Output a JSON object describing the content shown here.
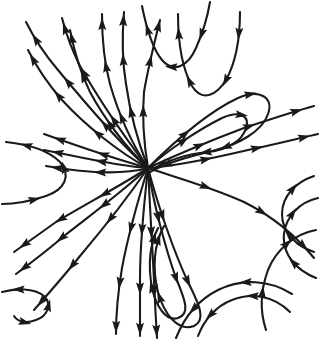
{
  "figure": {
    "kind": "phase-portrait",
    "title": "",
    "caption": "",
    "background_color": "#ffffff",
    "stroke_color": "#1a1a1a",
    "stroke_width": 2.1,
    "width": 319,
    "height": 340,
    "has_border": false,
    "has_axes": false,
    "has_labels": false,
    "has_gridlines": false
  },
  "chart_data": {
    "type": "line",
    "title": "",
    "xlabel": "",
    "ylabel": "",
    "xlim": [
      0,
      319
    ],
    "ylim": [
      0,
      340
    ],
    "grid": false,
    "legend": "none",
    "critical_points": [
      {
        "name": "degenerate-node",
        "x": 148,
        "y": 168,
        "classification": "improper/degenerate node (saddle-node)"
      }
    ],
    "separatrix_directions_deg": [
      205,
      25,
      95,
      275
    ],
    "streamline_count": 28,
    "arrow_count": 92,
    "streamlines": [
      {
        "id": "s01",
        "d": "M 148 168 C 120 144 86 104 58 70 C 46 56 34 38 26 22",
        "arrows": [
          0.3,
          0.6,
          0.88
        ],
        "dir": "forward"
      },
      {
        "id": "s02",
        "d": "M 148 168 C 124 136 98 98 80 66 C 72 50 66 34 62 18",
        "arrows": [
          0.32,
          0.64,
          0.92
        ],
        "dir": "forward"
      },
      {
        "id": "s03",
        "d": "M 148 168 C 118 152 84 124 62 100 C 48 84 36 66 28 50",
        "arrows": [
          0.34,
          0.66,
          0.92
        ],
        "dir": "forward"
      },
      {
        "id": "s04",
        "d": "M 148 168 C 126 148 104 118 90 92 C 80 72 74 50 70 30",
        "arrows": [
          0.34,
          0.68,
          0.93
        ],
        "dir": "forward"
      },
      {
        "id": "s05",
        "d": "M 148 168 C 132 144 118 112 110 84 C 104 62 102 38 102 14",
        "arrows": [
          0.33,
          0.66,
          0.92
        ],
        "dir": "forward"
      },
      {
        "id": "s06",
        "d": "M 148 168 C 138 142 130 112 126 84 C 122 60 122 36 124 12",
        "arrows": [
          0.35,
          0.68,
          0.93
        ],
        "dir": "forward"
      },
      {
        "id": "s07",
        "d": "M 148 168 C 144 144 142 116 144 92 C 148 68 154 44 160 20",
        "arrows": [
          0.36,
          0.7,
          0.94
        ],
        "dir": "forward"
      },
      {
        "id": "s08",
        "d": "M 148 168 C 112 158 72 144 44 134",
        "arrows": [
          0.4,
          0.82
        ],
        "dir": "forward"
      },
      {
        "id": "s09",
        "d": "M 148 168 C 116 166 76 156 44 150",
        "arrows": [
          0.42,
          0.84
        ],
        "dir": "forward"
      },
      {
        "id": "s10",
        "d": "M 148 168 C 118 176 80 172 46 166",
        "arrows": [
          0.44,
          0.86
        ],
        "dir": "forward"
      },
      {
        "id": "s11",
        "d": "M 148 168 C 120 186 86 204 56 222 C 42 232 28 242 14 252",
        "arrows": [
          0.3,
          0.62,
          0.9
        ],
        "dir": "forward"
      },
      {
        "id": "s12",
        "d": "M 148 168 C 122 192 92 214 64 236 C 48 250 32 262 16 274",
        "arrows": [
          0.32,
          0.64,
          0.92
        ],
        "dir": "forward"
      },
      {
        "id": "s13",
        "d": "M 148 168 C 126 200 102 230 80 256 C 64 276 48 294 34 310",
        "arrows": [
          0.33,
          0.66,
          0.92
        ],
        "dir": "forward"
      },
      {
        "id": "s14",
        "d": "M 148 168 C 138 200 128 236 122 268 C 118 292 116 314 116 334",
        "arrows": [
          0.35,
          0.68,
          0.94
        ],
        "dir": "forward"
      },
      {
        "id": "s15",
        "d": "M 148 168 C 144 204 140 244 140 278 C 140 302 140 320 140 336",
        "arrows": [
          0.35,
          0.7,
          0.94
        ],
        "dir": "forward"
      },
      {
        "id": "s16",
        "d": "M 148 168 C 150 206 152 246 154 280 C 155 304 156 322 157 338",
        "arrows": [
          0.36,
          0.7,
          0.94
        ],
        "dir": "forward"
      },
      {
        "id": "s17",
        "d": "M 148 168 C 154 206 166 250 176 278 C 186 302 190 314 178 318 C 166 322 156 306 152 288 C 148 266 150 244 158 228",
        "arrows": [
          0.18,
          0.42,
          0.76,
          0.95
        ],
        "dir": "forward"
      },
      {
        "id": "s18",
        "d": "M 148 168 C 158 206 174 252 188 282 C 200 306 206 320 194 326 C 178 332 164 314 158 292 C 152 268 154 244 164 226",
        "arrows": [
          0.16,
          0.4,
          0.74,
          0.94
        ],
        "dir": "forward"
      },
      {
        "id": "s19",
        "d": "M 148 168 C 168 150 198 130 222 118 C 240 110 250 116 246 128 C 242 142 226 150 208 152 C 188 154 168 160 152 170",
        "arrows": [
          0.18,
          0.46,
          0.74,
          0.94
        ],
        "dir": "forward"
      },
      {
        "id": "s20",
        "d": "M 148 168 C 172 144 208 112 238 98 C 260 88 274 98 268 114 C 262 132 238 144 216 150 C 192 156 168 162 150 172",
        "arrows": [
          0.16,
          0.42,
          0.72,
          0.93
        ],
        "dir": "forward"
      },
      {
        "id": "s21",
        "d": "M 148 168 C 174 156 212 140 244 128 C 268 120 292 112 314 106",
        "arrows": [
          0.3,
          0.6,
          0.88
        ],
        "dir": "forward"
      },
      {
        "id": "s22",
        "d": "M 148 168 C 176 166 214 158 248 150 C 276 144 300 138 318 134",
        "arrows": [
          0.32,
          0.62,
          0.9
        ],
        "dir": "forward"
      },
      {
        "id": "s23",
        "d": "M 148 168 C 178 178 214 188 244 202 C 272 216 296 236 314 258",
        "arrows": [
          0.3,
          0.62,
          0.9
        ],
        "dir": "forward"
      },
      {
        "id": "s24",
        "d": "M 178 14 C 178 40 182 68 192 86 C 202 102 216 96 226 80 C 236 62 240 36 240 12",
        "arrows": [
          0.12,
          0.38,
          0.64,
          0.9
        ],
        "dir": "reverse"
      },
      {
        "id": "s25",
        "d": "M 142 6 C 146 26 152 48 162 60 C 174 74 188 66 196 48 C 204 30 208 14 210 2",
        "arrows": [
          0.18,
          0.48,
          0.8
        ],
        "dir": "reverse"
      },
      {
        "id": "s26",
        "d": "M 6 142 C 26 144 48 150 60 162 C 72 176 64 190 46 196 C 28 202 12 204 2 204",
        "arrows": [
          0.16,
          0.46,
          0.8
        ],
        "dir": "reverse"
      },
      {
        "id": "s27",
        "d": "M 2 292 C 16 288 34 288 44 296 C 52 304 48 316 36 320 C 26 324 18 322 14 316",
        "arrows": [
          0.2,
          0.58,
          0.9
        ],
        "dir": "reverse"
      },
      {
        "id": "s28",
        "d": "M 314 176 C 296 182 282 196 282 214 C 282 232 296 246 314 252",
        "arrows": [
          0.26,
          0.74
        ],
        "dir": "reverse"
      },
      {
        "id": "s29",
        "d": "M 318 198 C 300 202 286 216 284 234 C 282 254 296 270 316 278",
        "arrows": [
          0.3,
          0.78
        ],
        "dir": "reverse"
      },
      {
        "id": "s30",
        "d": "M 316 230 C 294 234 276 250 268 270 C 260 292 260 312 266 330",
        "arrows": [
          0.28,
          0.72
        ],
        "dir": "reverse"
      },
      {
        "id": "s31",
        "d": "M 198 336 C 204 320 216 306 232 300 C 252 292 274 296 290 312",
        "arrows": [
          0.24,
          0.66
        ],
        "dir": "reverse"
      },
      {
        "id": "s32",
        "d": "M 176 338 C 184 318 198 300 218 290 C 242 278 270 280 292 294",
        "arrows": [
          0.26,
          0.68
        ],
        "dir": "reverse"
      }
    ]
  }
}
